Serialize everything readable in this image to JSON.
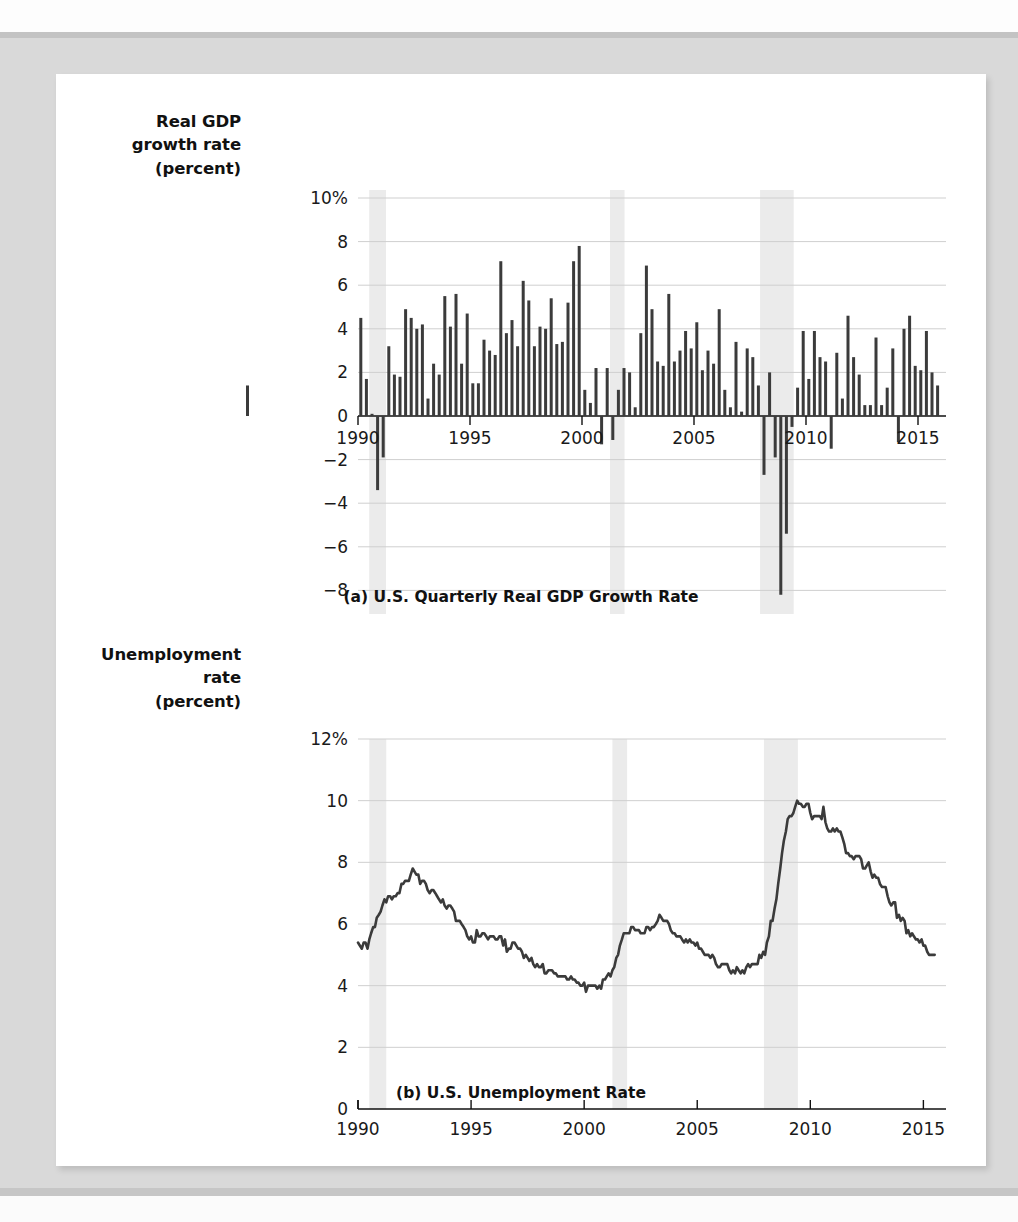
{
  "figure": {
    "panels": [
      {
        "id": "gdp",
        "caption": "(a) U.S. Quarterly Real GDP Growth Rate",
        "axis_title_lines": [
          "Real GDP",
          "growth rate",
          "(percent)"
        ]
      },
      {
        "id": "unemployment",
        "caption": "(b) U.S. Unemployment Rate",
        "axis_title_lines": [
          "Unemployment",
          "rate",
          "(percent)"
        ]
      }
    ]
  },
  "colors": {
    "bar": "#3b3b3b",
    "line": "#3b3b3b",
    "gridline": "#cfcfcf",
    "axis": "#111111",
    "recession_band": "#ebebeb",
    "panel_background": "#ffffff",
    "page_background": "#d9d9d9"
  },
  "chart_data": [
    {
      "type": "bar",
      "id": "gdp",
      "title": "(a) U.S. Quarterly Real GDP Growth Rate",
      "xlabel": "",
      "ylabel": "Real GDP growth rate (percent)",
      "xlim": [
        1990.0,
        2016.25
      ],
      "ylim": [
        -10,
        10
      ],
      "grid": true,
      "legend": "none",
      "ytick_labels": [
        "10%",
        "8",
        "6",
        "4",
        "2",
        "0",
        "-2",
        "-4",
        "-6",
        "-8",
        "-10"
      ],
      "ytick_values": [
        10,
        8,
        6,
        4,
        2,
        0,
        -2,
        -4,
        -6,
        -8,
        -10
      ],
      "xtick_labels": [
        "1990",
        "1995",
        "2000",
        "2005",
        "2010",
        "2015"
      ],
      "xtick_values": [
        1990,
        1995,
        2000,
        2005,
        2010,
        2015
      ],
      "recession_bands": [
        [
          1990.5,
          1991.25
        ],
        [
          2001.25,
          2001.9
        ],
        [
          2007.95,
          2009.45
        ]
      ],
      "x": [
        1990.0,
        1990.25,
        1990.5,
        1990.75,
        1991.0,
        1991.25,
        1991.5,
        1991.75,
        1992.0,
        1992.25,
        1992.5,
        1992.75,
        1993.0,
        1993.25,
        1993.5,
        1993.75,
        1994.0,
        1994.25,
        1994.5,
        1994.75,
        1995.0,
        1995.25,
        1995.5,
        1995.75,
        1996.0,
        1996.25,
        1996.5,
        1996.75,
        1997.0,
        1997.25,
        1997.5,
        1997.75,
        1998.0,
        1998.25,
        1998.5,
        1998.75,
        1999.0,
        1999.25,
        1999.5,
        1999.75,
        2000.0,
        2000.25,
        2000.5,
        2000.75,
        2001.0,
        2001.25,
        2001.5,
        2001.75,
        2002.0,
        2002.25,
        2002.5,
        2002.75,
        2003.0,
        2003.25,
        2003.5,
        2003.75,
        2004.0,
        2004.25,
        2004.5,
        2004.75,
        2005.0,
        2005.25,
        2005.5,
        2005.75,
        2006.0,
        2006.25,
        2006.5,
        2006.75,
        2007.0,
        2007.25,
        2007.5,
        2007.75,
        2008.0,
        2008.25,
        2008.5,
        2008.75,
        2009.0,
        2009.25,
        2009.5,
        2009.75,
        2010.0,
        2010.25,
        2010.5,
        2010.75,
        2011.0,
        2011.25,
        2011.5,
        2011.75,
        2012.0,
        2012.25,
        2012.5,
        2012.75,
        2013.0,
        2013.25,
        2013.5,
        2013.75,
        2014.0,
        2014.25,
        2014.5,
        2014.75,
        2015.0,
        2015.25,
        2015.5,
        2015.75
      ],
      "values": [
        4.5,
        1.7,
        0.1,
        -3.4,
        -1.9,
        3.2,
        1.9,
        1.8,
        4.9,
        4.5,
        4.0,
        4.2,
        0.8,
        2.4,
        1.9,
        5.5,
        4.1,
        5.6,
        2.4,
        4.7,
        1.5,
        1.5,
        3.5,
        3.0,
        2.8,
        7.1,
        3.8,
        4.4,
        3.2,
        6.2,
        5.3,
        3.2,
        4.1,
        4.0,
        5.4,
        3.3,
        3.4,
        5.2,
        7.1,
        7.8,
        1.2,
        0.6,
        2.2,
        -1.3,
        2.2,
        -1.1,
        1.2,
        2.2,
        2.0,
        0.4,
        3.8,
        6.9,
        4.9,
        2.5,
        2.3,
        5.6,
        2.5,
        3.0,
        3.9,
        3.1,
        4.3,
        2.1,
        3.0,
        2.4,
        4.9,
        1.2,
        0.4,
        3.4,
        0.2,
        3.1,
        2.7,
        1.4,
        -2.7,
        2.0,
        -1.9,
        -8.2,
        -5.4,
        -0.5,
        1.3,
        3.9,
        1.7,
        3.9,
        2.7,
        2.5,
        -1.5,
        2.9,
        0.8,
        4.6,
        2.7,
        1.9,
        0.5,
        0.5,
        3.6,
        0.5,
        1.3,
        3.1,
        -1.2,
        4.0,
        4.6,
        2.3,
        2.1,
        3.9,
        2.0,
        1.4,
        1.4
      ]
    },
    {
      "type": "line",
      "id": "unemployment",
      "title": "(b) U.S. Unemployment Rate",
      "xlabel": "",
      "ylabel": "Unemployment rate (percent)",
      "xlim": [
        1990.0,
        2016.0
      ],
      "ylim": [
        0,
        12
      ],
      "grid": true,
      "legend": "none",
      "ytick_labels": [
        "12%",
        "10",
        "8",
        "6",
        "4",
        "2",
        "0"
      ],
      "ytick_values": [
        12,
        10,
        8,
        6,
        4,
        2,
        0
      ],
      "xtick_labels": [
        "1990",
        "1995",
        "2000",
        "2005",
        "2010",
        "2015"
      ],
      "xtick_values": [
        1990,
        1995,
        2000,
        2005,
        2010,
        2015
      ],
      "recession_bands": [
        [
          1990.5,
          1991.25
        ],
        [
          2001.25,
          2001.9
        ],
        [
          2007.95,
          2009.45
        ]
      ],
      "series_name": "U.S. unemployment rate (monthly, percent)",
      "x": [
        1990.0,
        1990.08,
        1990.17,
        1990.25,
        1990.33,
        1990.42,
        1990.5,
        1990.58,
        1990.67,
        1990.75,
        1990.83,
        1990.92,
        1991.0,
        1991.08,
        1991.17,
        1991.25,
        1991.33,
        1991.42,
        1991.5,
        1991.58,
        1991.67,
        1991.75,
        1991.83,
        1991.92,
        1992.0,
        1992.08,
        1992.17,
        1992.25,
        1992.33,
        1992.42,
        1992.5,
        1992.58,
        1992.67,
        1992.75,
        1992.83,
        1992.92,
        1993.0,
        1993.08,
        1993.17,
        1993.25,
        1993.33,
        1993.42,
        1993.5,
        1993.58,
        1993.67,
        1993.75,
        1993.83,
        1993.92,
        1994.0,
        1994.08,
        1994.17,
        1994.25,
        1994.33,
        1994.42,
        1994.5,
        1994.58,
        1994.67,
        1994.75,
        1994.83,
        1994.92,
        1995.0,
        1995.08,
        1995.17,
        1995.25,
        1995.33,
        1995.42,
        1995.5,
        1995.58,
        1995.67,
        1995.75,
        1995.83,
        1995.92,
        1996.0,
        1996.08,
        1996.17,
        1996.25,
        1996.33,
        1996.42,
        1996.5,
        1996.58,
        1996.67,
        1996.75,
        1996.83,
        1996.92,
        1997.0,
        1997.08,
        1997.17,
        1997.25,
        1997.33,
        1997.42,
        1997.5,
        1997.58,
        1997.67,
        1997.75,
        1997.83,
        1997.92,
        1998.0,
        1998.08,
        1998.17,
        1998.25,
        1998.33,
        1998.42,
        1998.5,
        1998.58,
        1998.67,
        1998.75,
        1998.83,
        1998.92,
        1999.0,
        1999.08,
        1999.17,
        1999.25,
        1999.33,
        1999.42,
        1999.5,
        1999.58,
        1999.67,
        1999.75,
        1999.83,
        1999.92,
        2000.0,
        2000.08,
        2000.17,
        2000.25,
        2000.33,
        2000.42,
        2000.5,
        2000.58,
        2000.67,
        2000.75,
        2000.83,
        2000.92,
        2001.0,
        2001.08,
        2001.17,
        2001.25,
        2001.33,
        2001.42,
        2001.5,
        2001.58,
        2001.67,
        2001.75,
        2001.83,
        2001.92,
        2002.0,
        2002.08,
        2002.17,
        2002.25,
        2002.33,
        2002.42,
        2002.5,
        2002.58,
        2002.67,
        2002.75,
        2002.83,
        2002.92,
        2003.0,
        2003.08,
        2003.17,
        2003.25,
        2003.33,
        2003.42,
        2003.5,
        2003.58,
        2003.67,
        2003.75,
        2003.83,
        2003.92,
        2004.0,
        2004.08,
        2004.17,
        2004.25,
        2004.33,
        2004.42,
        2004.5,
        2004.58,
        2004.67,
        2004.75,
        2004.83,
        2004.92,
        2005.0,
        2005.08,
        2005.17,
        2005.25,
        2005.33,
        2005.42,
        2005.5,
        2005.58,
        2005.67,
        2005.75,
        2005.83,
        2005.92,
        2006.0,
        2006.08,
        2006.17,
        2006.25,
        2006.33,
        2006.42,
        2006.5,
        2006.58,
        2006.67,
        2006.75,
        2006.83,
        2006.92,
        2007.0,
        2007.08,
        2007.17,
        2007.25,
        2007.33,
        2007.42,
        2007.5,
        2007.58,
        2007.67,
        2007.75,
        2007.83,
        2007.92,
        2008.0,
        2008.08,
        2008.17,
        2008.25,
        2008.33,
        2008.42,
        2008.5,
        2008.58,
        2008.67,
        2008.75,
        2008.83,
        2008.92,
        2009.0,
        2009.08,
        2009.17,
        2009.25,
        2009.33,
        2009.42,
        2009.5,
        2009.58,
        2009.67,
        2009.75,
        2009.83,
        2009.92,
        2010.0,
        2010.08,
        2010.17,
        2010.25,
        2010.33,
        2010.42,
        2010.5,
        2010.58,
        2010.67,
        2010.75,
        2010.83,
        2010.92,
        2011.0,
        2011.08,
        2011.17,
        2011.25,
        2011.33,
        2011.42,
        2011.5,
        2011.58,
        2011.67,
        2011.75,
        2011.83,
        2011.92,
        2012.0,
        2012.08,
        2012.17,
        2012.25,
        2012.33,
        2012.42,
        2012.5,
        2012.58,
        2012.67,
        2012.75,
        2012.83,
        2012.92,
        2013.0,
        2013.08,
        2013.17,
        2013.25,
        2013.33,
        2013.42,
        2013.5,
        2013.58,
        2013.67,
        2013.75,
        2013.83,
        2013.92,
        2014.0,
        2014.08,
        2014.17,
        2014.25,
        2014.33,
        2014.42,
        2014.5,
        2014.58,
        2014.67,
        2014.75,
        2014.83,
        2014.92,
        2015.0,
        2015.08,
        2015.17,
        2015.25,
        2015.33,
        2015.42,
        2015.5,
        2015.58,
        2015.67,
        2015.75,
        2015.83,
        2015.92
      ],
      "values": [
        5.4,
        5.3,
        5.2,
        5.4,
        5.4,
        5.2,
        5.5,
        5.7,
        5.9,
        5.9,
        6.2,
        6.3,
        6.4,
        6.6,
        6.8,
        6.7,
        6.9,
        6.9,
        6.8,
        6.9,
        6.9,
        7.0,
        7.0,
        7.3,
        7.3,
        7.4,
        7.4,
        7.4,
        7.6,
        7.8,
        7.7,
        7.6,
        7.6,
        7.3,
        7.4,
        7.4,
        7.3,
        7.1,
        7.0,
        7.1,
        7.1,
        7.0,
        6.9,
        6.8,
        6.7,
        6.8,
        6.6,
        6.5,
        6.6,
        6.6,
        6.5,
        6.4,
        6.1,
        6.1,
        6.1,
        6.0,
        5.9,
        5.8,
        5.6,
        5.5,
        5.6,
        5.4,
        5.4,
        5.8,
        5.6,
        5.6,
        5.7,
        5.7,
        5.6,
        5.5,
        5.6,
        5.6,
        5.6,
        5.5,
        5.5,
        5.6,
        5.6,
        5.3,
        5.5,
        5.1,
        5.2,
        5.2,
        5.4,
        5.4,
        5.3,
        5.2,
        5.2,
        5.1,
        4.9,
        5.0,
        4.9,
        4.8,
        4.9,
        4.7,
        4.6,
        4.7,
        4.6,
        4.6,
        4.7,
        4.4,
        4.4,
        4.5,
        4.5,
        4.5,
        4.4,
        4.4,
        4.3,
        4.3,
        4.3,
        4.3,
        4.3,
        4.2,
        4.2,
        4.3,
        4.2,
        4.2,
        4.1,
        4.1,
        4.0,
        4.0,
        4.1,
        3.8,
        4.0,
        4.0,
        4.0,
        4.0,
        4.0,
        3.9,
        4.0,
        3.9,
        4.2,
        4.2,
        4.3,
        4.4,
        4.3,
        4.5,
        4.6,
        4.9,
        5.0,
        5.3,
        5.5,
        5.7,
        5.7,
        5.7,
        5.7,
        5.9,
        5.9,
        5.8,
        5.8,
        5.8,
        5.7,
        5.7,
        5.7,
        5.9,
        5.9,
        5.8,
        5.9,
        5.9,
        6.0,
        6.1,
        6.3,
        6.2,
        6.1,
        6.1,
        6.1,
        6.0,
        5.8,
        5.7,
        5.7,
        5.6,
        5.6,
        5.6,
        5.5,
        5.4,
        5.5,
        5.4,
        5.5,
        5.4,
        5.4,
        5.3,
        5.4,
        5.2,
        5.2,
        5.1,
        5.0,
        5.0,
        5.0,
        4.9,
        5.0,
        4.9,
        4.7,
        4.6,
        4.6,
        4.7,
        4.7,
        4.7,
        4.7,
        4.5,
        4.4,
        4.5,
        4.4,
        4.6,
        4.5,
        4.4,
        4.5,
        4.4,
        4.6,
        4.7,
        4.6,
        4.7,
        4.7,
        4.7,
        4.7,
        5.0,
        4.9,
        5.1,
        5.0,
        5.4,
        5.6,
        6.1,
        6.1,
        6.5,
        6.8,
        7.3,
        7.8,
        8.3,
        8.7,
        9.0,
        9.4,
        9.5,
        9.5,
        9.6,
        9.8,
        10.0,
        9.9,
        9.9,
        9.8,
        9.8,
        9.9,
        9.9,
        9.6,
        9.4,
        9.5,
        9.5,
        9.5,
        9.5,
        9.4,
        9.8,
        9.3,
        9.1,
        9.0,
        9.0,
        9.1,
        9.0,
        9.1,
        9.0,
        9.0,
        8.8,
        8.6,
        8.3,
        8.3,
        8.2,
        8.2,
        8.1,
        8.2,
        8.2,
        8.2,
        8.1,
        7.8,
        7.8,
        7.9,
        8.0,
        7.7,
        7.5,
        7.6,
        7.5,
        7.5,
        7.3,
        7.2,
        7.2,
        7.2,
        6.9,
        6.7,
        6.6,
        6.7,
        6.7,
        6.2,
        6.3,
        6.1,
        6.2,
        6.1,
        5.7,
        5.8,
        5.6,
        5.7,
        5.6,
        5.5,
        5.5,
        5.4,
        5.5,
        5.3,
        5.3,
        5.1,
        5.0,
        5.0,
        5.0,
        5.0
      ]
    }
  ]
}
